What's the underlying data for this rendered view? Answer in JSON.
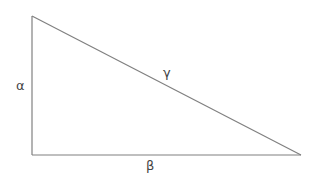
{
  "diagram": {
    "type": "right-triangle",
    "stroke_color": "#808080",
    "label_color": "#444444",
    "vertices": {
      "top": [
        32,
        16
      ],
      "bottom_left": [
        32,
        155
      ],
      "bottom_right": [
        301,
        155
      ]
    },
    "labels": {
      "vertical_side": "α",
      "horizontal_side": "β",
      "hypotenuse": "γ"
    }
  }
}
